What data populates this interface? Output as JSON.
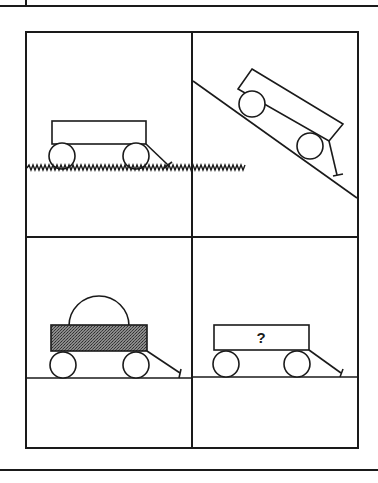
{
  "diagram": {
    "type": "four-panel physics puzzle",
    "panels": [
      {
        "id": "top-left",
        "description": "Wagon resting on grassy ground",
        "surface": "grass"
      },
      {
        "id": "top-right",
        "description": "Wagon on an inclined slope",
        "surface": "incline"
      },
      {
        "id": "bottom-left",
        "description": "Wagon with shaded (heavy) body and dome-shaped load on flat ground",
        "surface": "flat"
      },
      {
        "id": "bottom-right",
        "description": "Wagon on flat ground with unknown condition",
        "surface": "flat",
        "label": "?"
      }
    ],
    "colors": {
      "ink": "#1a1a1a",
      "background": "#ffffff",
      "shading": "#6e6e6e"
    }
  }
}
